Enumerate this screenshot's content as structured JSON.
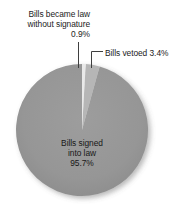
{
  "chart_data": {
    "type": "pie",
    "title": "",
    "subtitle": "",
    "xlabel": "",
    "ylabel": "",
    "legend_position": "none",
    "grid": false,
    "categories": [
      "Bills signed into law",
      "Bills vetoed",
      "Bills became law without signature"
    ],
    "values": [
      95.7,
      3.4,
      0.9
    ],
    "units": "%",
    "slices": [
      {
        "name": "Bills signed into law",
        "value": 95.7,
        "value_label": "95.7%",
        "color": "#969696",
        "label_placement": "inside"
      },
      {
        "name": "Bills vetoed",
        "value": 3.4,
        "value_label": "3.4%",
        "color": "#b6b6b6",
        "label_placement": "outside-right"
      },
      {
        "name": "Bills became law without signature",
        "value": 0.9,
        "value_label": "0.9%",
        "color": "#e9e9e9",
        "label_placement": "outside-top-left"
      }
    ],
    "start_angle_deg": 0,
    "direction": "clockwise"
  },
  "labels": {
    "no_signature": {
      "line1": "Bills became law",
      "line2": "without signature",
      "line3": "0.9%"
    },
    "vetoed": {
      "text": "Bills vetoed 3.4%"
    },
    "signed": {
      "line1": "Bills signed",
      "line2": "into law",
      "line3": "95.7%"
    }
  },
  "colors": {
    "slice_signed": "#969696",
    "slice_vetoed": "#b6b6b6",
    "slice_no_signature": "#e9e9e9",
    "leader_line": "#4a4a4a",
    "text": "#1b1b1b",
    "background": "#ffffff"
  }
}
